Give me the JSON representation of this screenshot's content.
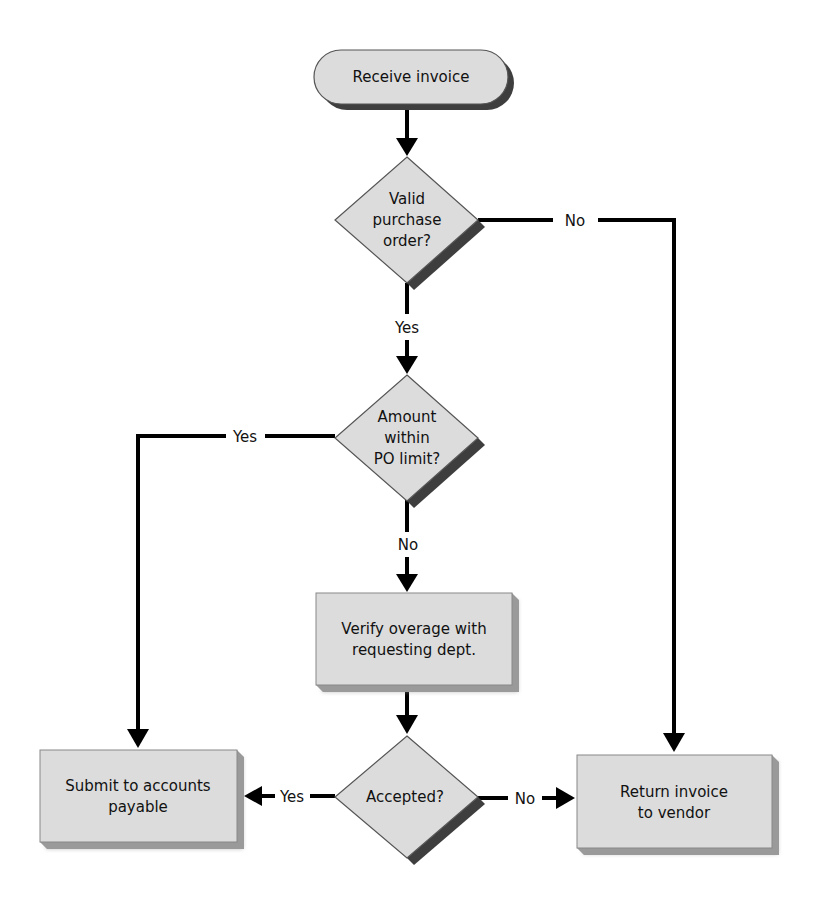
{
  "diagram": {
    "type": "flowchart",
    "colors": {
      "node_fill": "#dcdcdc",
      "node_stroke": "#555555",
      "shadow": "#3e3e3e",
      "bevel": "#9a9a9a",
      "connector": "#000000"
    },
    "nodes": {
      "start": {
        "shape": "terminator",
        "text": "Receive invoice"
      },
      "valid_po": {
        "shape": "decision",
        "lines": [
          "Valid",
          "purchase",
          "order?"
        ]
      },
      "amount_within": {
        "shape": "decision",
        "lines": [
          "Amount",
          "within",
          "PO limit?"
        ]
      },
      "verify": {
        "shape": "process",
        "lines": [
          "Verify overage with",
          "requesting dept."
        ]
      },
      "accepted": {
        "shape": "decision",
        "lines": [
          "Accepted?"
        ]
      },
      "submit": {
        "shape": "process",
        "lines": [
          "Submit to accounts",
          "payable"
        ]
      },
      "return": {
        "shape": "process",
        "lines": [
          "Return invoice",
          "to vendor"
        ]
      }
    },
    "edges": [
      {
        "from": "start",
        "to": "valid_po",
        "label": ""
      },
      {
        "from": "valid_po",
        "to": "return",
        "label": "No"
      },
      {
        "from": "valid_po",
        "to": "amount_within",
        "label": "Yes"
      },
      {
        "from": "amount_within",
        "to": "submit",
        "label": "Yes"
      },
      {
        "from": "amount_within",
        "to": "verify",
        "label": "No"
      },
      {
        "from": "verify",
        "to": "accepted",
        "label": ""
      },
      {
        "from": "accepted",
        "to": "submit",
        "label": "Yes"
      },
      {
        "from": "accepted",
        "to": "return",
        "label": "No"
      }
    ],
    "labels": {
      "valid_no": "No",
      "valid_yes": "Yes",
      "amount_yes": "Yes",
      "amount_no": "No",
      "accepted_yes": "Yes",
      "accepted_no": "No"
    }
  }
}
